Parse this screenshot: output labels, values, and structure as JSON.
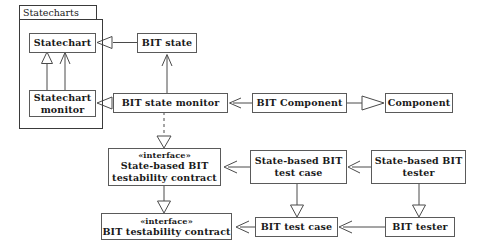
{
  "diagram": {
    "package": {
      "name": "Statecharts"
    },
    "stereotype_interface": "«interface»",
    "nodes": [
      {
        "id": "statechart",
        "label": "Statechart",
        "lines": [
          "Statechart"
        ]
      },
      {
        "id": "bit-state",
        "label": "BIT state",
        "lines": [
          "BIT state"
        ]
      },
      {
        "id": "statechart-monitor",
        "label": "Statechart monitor",
        "lines": [
          "Statechart",
          "monitor"
        ]
      },
      {
        "id": "bit-state-monitor",
        "label": "BIT state monitor",
        "lines": [
          "BIT state monitor"
        ]
      },
      {
        "id": "bit-component",
        "label": "BIT Component",
        "lines": [
          "BIT Component"
        ]
      },
      {
        "id": "component",
        "label": "Component",
        "lines": [
          "Component"
        ]
      },
      {
        "id": "state-based-contract",
        "label": "State-based BIT testability contract",
        "lines": [
          "State-based BIT",
          "testability contract"
        ]
      },
      {
        "id": "state-based-test-case",
        "label": "State-based BIT test case",
        "lines": [
          "State-based BIT",
          "test case"
        ]
      },
      {
        "id": "state-based-tester",
        "label": "State-based BIT tester",
        "lines": [
          "State-based BIT",
          "tester"
        ]
      },
      {
        "id": "bit-contract",
        "label": "BIT testability contract",
        "lines": [
          "BIT testability contract"
        ]
      },
      {
        "id": "bit-test-case",
        "label": "BIT test case",
        "lines": [
          "BIT test case"
        ]
      },
      {
        "id": "bit-tester",
        "label": "BIT tester",
        "lines": [
          "BIT tester"
        ]
      }
    ],
    "edges": [
      {
        "from": "statechart-monitor",
        "to": "statechart",
        "kind": "generalization"
      },
      {
        "from": "statechart-monitor",
        "to": "statechart",
        "kind": "association"
      },
      {
        "from": "bit-state",
        "to": "statechart",
        "kind": "generalization"
      },
      {
        "from": "bit-state-monitor",
        "to": "statechart-monitor",
        "kind": "generalization"
      },
      {
        "from": "bit-state-monitor",
        "to": "bit-state",
        "kind": "association"
      },
      {
        "from": "bit-component",
        "to": "bit-state-monitor",
        "kind": "association"
      },
      {
        "from": "bit-component",
        "to": "component",
        "kind": "generalization"
      },
      {
        "from": "bit-state-monitor",
        "to": "state-based-contract",
        "kind": "realization"
      },
      {
        "from": "state-based-test-case",
        "to": "state-based-contract",
        "kind": "association"
      },
      {
        "from": "state-based-tester",
        "to": "state-based-test-case",
        "kind": "association"
      },
      {
        "from": "state-based-contract",
        "to": "bit-contract",
        "kind": "generalization"
      },
      {
        "from": "state-based-test-case",
        "to": "bit-test-case",
        "kind": "generalization"
      },
      {
        "from": "state-based-tester",
        "to": "bit-tester",
        "kind": "generalization"
      },
      {
        "from": "bit-test-case",
        "to": "bit-contract",
        "kind": "association"
      },
      {
        "from": "bit-tester",
        "to": "bit-test-case",
        "kind": "association"
      }
    ],
    "colors": {
      "node_border": "#5a5a5a",
      "package_border": "#3a3a3a",
      "edge": "#4a4a4a",
      "background": "#ffffff",
      "text": "#1a1a1a"
    }
  }
}
